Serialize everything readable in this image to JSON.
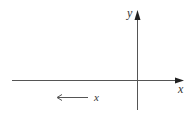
{
  "diagram": {
    "type": "coordinate-axes",
    "axes": {
      "x_label": "x",
      "y_label": "y"
    },
    "motion_arrow": {
      "direction": "left",
      "label": "x"
    },
    "colors": {
      "line": "#555555",
      "text": "#333333",
      "background": "#ffffff"
    }
  }
}
